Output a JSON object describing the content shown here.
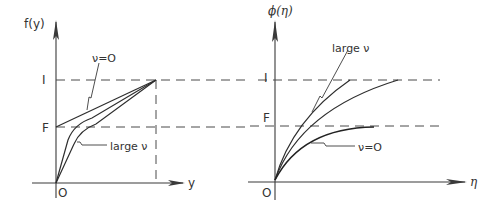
{
  "left_panel": {
    "y_axis_label": "f(y)",
    "x_axis_label": "y",
    "origin_label": "O",
    "level_upper_label": "I",
    "level_lower_label": "F",
    "annotation_top": "ν=O",
    "annotation_bottom": "large ν"
  },
  "right_panel": {
    "y_axis_label": "ϕ(η)",
    "x_axis_label": "η",
    "origin_label": "O",
    "level_upper_label": "I",
    "level_lower_label": "F",
    "annotation_top": "large ν",
    "annotation_bottom": "ν=O"
  }
}
